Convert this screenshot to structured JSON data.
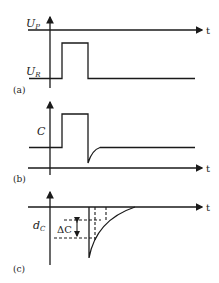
{
  "figure": {
    "panels": [
      {
        "id": "a",
        "caption": "(a)",
        "y_labels": {
          "upper": "U",
          "upper_sub": "P",
          "lower": "U",
          "lower_sub": "R"
        },
        "x_label": "t",
        "description": "Voltage pulse from U_R to U_P level"
      },
      {
        "id": "b",
        "caption": "(b)",
        "y_label": "C",
        "x_label": "t",
        "description": "Capacitance response with undershoot after pulse"
      },
      {
        "id": "c",
        "caption": "(c)",
        "y_label": "d",
        "y_label_sub": "C",
        "delta_label": "ΔC",
        "x_label": "t",
        "description": "Capacitance transient decay"
      }
    ],
    "colors": {
      "line": "#1a1a1a",
      "background": "#ffffff"
    }
  }
}
